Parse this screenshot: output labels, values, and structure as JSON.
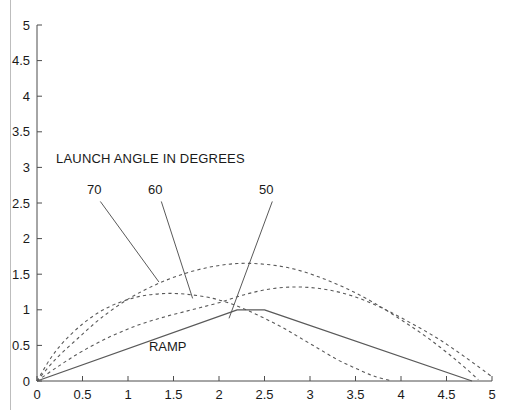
{
  "figure": {
    "background_color": "#ffffff",
    "axis_color": "#4d4d4d",
    "curve_color": "#595959",
    "text_color": "#1a1a1a"
  },
  "annotations": {
    "title": "LAUNCH ANGLE IN DEGREES",
    "ramp_label": "RAMP",
    "angle_labels": [
      "70",
      "60",
      "50"
    ]
  },
  "chart_data": {
    "type": "line",
    "title": "LAUNCH ANGLE IN DEGREES",
    "xlabel": "",
    "ylabel": "",
    "xlim": [
      0,
      5
    ],
    "ylim": [
      0,
      5
    ],
    "grid": false,
    "legend_position": "none",
    "xticks": [
      "0",
      "0.5",
      "1",
      "1.5",
      "2",
      "2.5",
      "3",
      "3.5",
      "4",
      "4.5",
      "5"
    ],
    "xtick_values": [
      0,
      0.5,
      1,
      1.5,
      2,
      2.5,
      3,
      3.5,
      4,
      4.5,
      5
    ],
    "yticks": [
      "0",
      "0.5",
      "1",
      "1.5",
      "2",
      "2.5",
      "3",
      "3.5",
      "4",
      "4.5",
      "5"
    ],
    "ytick_values": [
      0,
      0.5,
      1,
      1.5,
      2,
      2.5,
      3,
      3.5,
      4,
      4.5,
      5
    ],
    "series": [
      {
        "name": "70",
        "style": "dashed",
        "x": [
          0,
          0.15,
          0.3,
          0.5,
          0.7,
          0.9,
          1.1,
          1.3,
          1.5,
          1.7,
          1.9,
          2.1,
          2.3,
          2.5,
          2.7,
          2.9,
          3.1,
          3.3,
          3.5,
          3.7,
          3.9
        ],
        "y": [
          0,
          0.32,
          0.56,
          0.8,
          0.98,
          1.1,
          1.18,
          1.22,
          1.23,
          1.21,
          1.17,
          1.1,
          1.0,
          0.88,
          0.75,
          0.6,
          0.45,
          0.3,
          0.18,
          0.07,
          0.0
        ]
      },
      {
        "name": "60",
        "style": "dashed",
        "x": [
          0,
          0.2,
          0.45,
          0.7,
          1.0,
          1.3,
          1.6,
          1.9,
          2.2,
          2.5,
          2.8,
          3.1,
          3.4,
          3.7,
          4.0,
          4.3,
          4.6,
          4.85
        ],
        "y": [
          0,
          0.3,
          0.6,
          0.88,
          1.15,
          1.35,
          1.5,
          1.6,
          1.65,
          1.64,
          1.58,
          1.46,
          1.3,
          1.1,
          0.86,
          0.6,
          0.3,
          0.02
        ]
      },
      {
        "name": "50",
        "style": "dashed",
        "x": [
          0,
          0.25,
          0.5,
          0.8,
          1.1,
          1.4,
          1.7,
          2.0,
          2.3,
          2.6,
          2.9,
          3.2,
          3.5,
          3.8,
          4.1,
          4.4,
          4.7,
          5.0
        ],
        "y": [
          0,
          0.22,
          0.42,
          0.62,
          0.78,
          0.9,
          1.0,
          1.1,
          1.22,
          1.3,
          1.32,
          1.28,
          1.18,
          1.02,
          0.82,
          0.6,
          0.34,
          0.06
        ]
      },
      {
        "name": "RAMP",
        "style": "solid",
        "x": [
          0,
          2.2,
          2.5,
          4.78
        ],
        "y": [
          0,
          1.0,
          1.0,
          0.0
        ]
      }
    ],
    "callouts": [
      {
        "label": "70",
        "label_x": 0.63,
        "label_y": 2.62,
        "tip_x": 1.34,
        "tip_y": 1.39
      },
      {
        "label": "60",
        "label_x": 1.3,
        "label_y": 2.62,
        "tip_x": 1.71,
        "tip_y": 1.16
      },
      {
        "label": "50",
        "label_x": 2.52,
        "label_y": 2.62,
        "tip_x": 2.11,
        "tip_y": 0.88
      }
    ],
    "ramp_annotation": {
      "label": "RAMP",
      "x": 1.23,
      "y": 0.42
    }
  }
}
